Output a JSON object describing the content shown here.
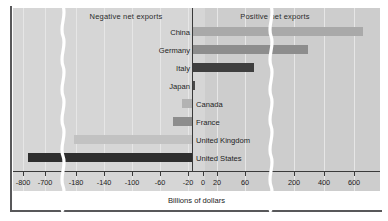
{
  "chart_data": {
    "type": "bar",
    "orientation": "horizontal",
    "title": "",
    "xlabel": "Billions of dollars",
    "ylabel": "",
    "categories": [
      "China",
      "Germany",
      "Italy",
      "Japan",
      "Canada",
      "France",
      "United Kingdom",
      "United States"
    ],
    "values": [
      680,
      295,
      60,
      2,
      -15,
      -28,
      -182,
      -762
    ],
    "tick_labels": [
      "-800",
      "-700",
      "-180",
      "-140",
      "-100",
      "-60",
      "-20",
      "0",
      "20",
      "60",
      "200",
      "400",
      "600"
    ],
    "tick_values": [
      -800,
      -700,
      -180,
      -140,
      -100,
      -60,
      -20,
      0,
      20,
      60,
      200,
      400,
      600
    ],
    "axis_breaks": 2,
    "grid": true,
    "legend": "none",
    "annotations": [
      {
        "text": "Negative net exports",
        "side": "left"
      },
      {
        "text": "Positive net exports",
        "side": "right"
      }
    ],
    "bar_colors": [
      "#a9a9a9",
      "#8d8d8d",
      "#3f3f3f",
      "#4a4a4a",
      "#b3b3b3",
      "#8d8d8d",
      "#c2c2c2",
      "#2e2e2e"
    ]
  },
  "captions": {
    "negative": "Negative net exports",
    "positive": "Positive net exports"
  },
  "axis": {
    "label": "Billions of dollars",
    "ticks": [
      {
        "label": "-800",
        "x": 23
      },
      {
        "label": "-700",
        "x": 45
      },
      {
        "label": "-180",
        "x": 76
      },
      {
        "label": "-140",
        "x": 104
      },
      {
        "label": "-100",
        "x": 132
      },
      {
        "label": "-60",
        "x": 160
      },
      {
        "label": "-20",
        "x": 188
      },
      {
        "label": "0",
        "x": 203
      },
      {
        "label": "20",
        "x": 217
      },
      {
        "label": "60",
        "x": 245
      },
      {
        "label": "200",
        "x": 294
      },
      {
        "label": "400",
        "x": 324
      },
      {
        "label": "600",
        "x": 354
      }
    ]
  },
  "rows": [
    {
      "label": "China",
      "value": 680,
      "color": "#a9a9a9",
      "side": "pos",
      "left": 193,
      "width": 170,
      "top": 27
    },
    {
      "label": "Germany",
      "value": 295,
      "color": "#8d8d8d",
      "side": "pos",
      "left": 193,
      "width": 115,
      "top": 45
    },
    {
      "label": "Italy",
      "value": 60,
      "color": "#3f3f3f",
      "side": "pos",
      "left": 193,
      "width": 61,
      "top": 63
    },
    {
      "label": "Japan",
      "value": 2,
      "color": "#4a4a4a",
      "side": "pos",
      "left": 193,
      "width": 2,
      "top": 81
    },
    {
      "label": "Canada",
      "value": -15,
      "color": "#b3b3b3",
      "side": "neg",
      "left": 182,
      "width": 10,
      "top": 99
    },
    {
      "label": "France",
      "value": -28,
      "color": "#8d8d8d",
      "side": "neg",
      "left": 173,
      "width": 19,
      "top": 117
    },
    {
      "label": "United Kingdom",
      "value": -182,
      "color": "#c2c2c2",
      "side": "neg",
      "left": 74,
      "width": 118,
      "top": 135
    },
    {
      "label": "United States",
      "value": -762,
      "color": "#2e2e2e",
      "side": "neg",
      "left": 28,
      "width": 164,
      "top": 153
    }
  ],
  "gridlines_x": [
    23,
    45,
    76,
    104,
    132,
    160,
    188,
    217,
    245,
    294,
    324,
    354
  ],
  "colors": {
    "plot_background": "#d6d6d6",
    "positive_region": "#cdcdcd",
    "frame": "#58585a",
    "axis": "#3a3a3a",
    "gridline": "#e6e6e6",
    "break": "#ffffff"
  }
}
